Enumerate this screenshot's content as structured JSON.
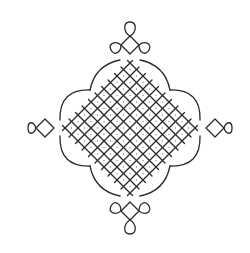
{
  "figure": {
    "kind": "kolam line drawing",
    "center": [
      130,
      128
    ],
    "cell": 13,
    "half_extent": 78,
    "stroke_color": "#2a2a2a",
    "dot_color": "#8a8a8a",
    "background": "#ffffff",
    "tips": [
      {
        "name": "top",
        "stem": [
          130,
          45
        ],
        "loops": [
          [
            130,
            22
          ],
          [
            111,
            50
          ],
          [
            149,
            50
          ]
        ]
      },
      {
        "name": "bottom",
        "stem": [
          130,
          211
        ],
        "loops": [
          [
            130,
            234
          ],
          [
            111,
            206
          ],
          [
            149,
            206
          ]
        ]
      },
      {
        "name": "left",
        "stem": [
          45,
          128
        ],
        "loops": [
          [
            28,
            128
          ]
        ]
      },
      {
        "name": "right",
        "stem": [
          215,
          128
        ],
        "loops": [
          [
            232,
            128
          ]
        ]
      }
    ]
  }
}
